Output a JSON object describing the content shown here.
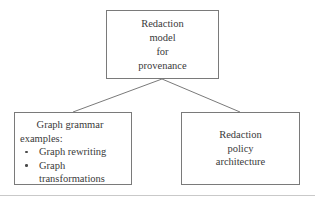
{
  "diagram": {
    "type": "tree",
    "background_color": "#ffffff",
    "border_color": "#7a7a7a",
    "text_color": "#3a3a3a",
    "nodes": {
      "root": {
        "name": "Redaction model for provenance",
        "lines": [
          "Redaction",
          "model",
          "for",
          "provenance"
        ]
      },
      "graph_grammar": {
        "name": "Graph grammar examples",
        "heading_line_1": "Graph grammar",
        "heading_line_2": "examples:",
        "bullets": [
          {
            "text": "Graph rewriting",
            "continuation": ""
          },
          {
            "text": "Graph",
            "continuation": "transformations"
          }
        ],
        "bullet_icon": "round-bullet"
      },
      "redaction_policy": {
        "name": "Redaction policy architecture",
        "lines": [
          "Redaction",
          "policy",
          "architecture"
        ]
      }
    },
    "connectors": [
      {
        "name": "root-to-graph-grammar",
        "from": "root",
        "to": "graph_grammar"
      },
      {
        "name": "root-to-redaction-policy",
        "from": "root",
        "to": "redaction_policy"
      }
    ]
  }
}
